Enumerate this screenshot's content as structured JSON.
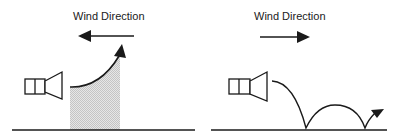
{
  "panels": [
    {
      "id": "upwind",
      "label": "Wind Direction",
      "wind_arrow_direction": "left",
      "sound_path": "refracted upward, creating shadow zone near ground",
      "shadow_zone": true
    },
    {
      "id": "downwind",
      "label": "Wind Direction",
      "wind_arrow_direction": "right",
      "sound_path": "refracted downward, bouncing along ground",
      "shadow_zone": false
    }
  ],
  "colors": {
    "line": "#1a1a1a",
    "shadow_fill": "#d9d9d9",
    "background": "#ffffff"
  }
}
